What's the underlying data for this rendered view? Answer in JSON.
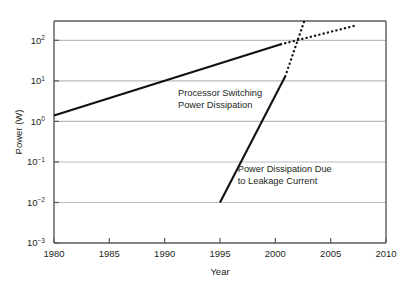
{
  "chart_data": {
    "type": "line",
    "title": "",
    "xlabel": "Year",
    "ylabel": "Power (W)",
    "xlim": [
      1980,
      2010
    ],
    "ylim": [
      0.001,
      300
    ],
    "yscale": "log",
    "grid": true,
    "legend_position": "none",
    "x_ticks": [
      {
        "value": 1980,
        "label": "1980"
      },
      {
        "value": 1985,
        "label": "1985"
      },
      {
        "value": 1990,
        "label": "1990"
      },
      {
        "value": 1995,
        "label": "1995"
      },
      {
        "value": 2000,
        "label": "2000"
      },
      {
        "value": 2005,
        "label": "2005"
      },
      {
        "value": 2010,
        "label": "2010"
      }
    ],
    "y_ticks": [
      {
        "value": 100,
        "mantissa": "10",
        "exponent": "2"
      },
      {
        "value": 10,
        "mantissa": "10",
        "exponent": "1"
      },
      {
        "value": 1,
        "mantissa": "10",
        "exponent": "0"
      },
      {
        "value": 0.1,
        "mantissa": "10",
        "exponent": "−1"
      },
      {
        "value": 0.01,
        "mantissa": "10",
        "exponent": "−2"
      },
      {
        "value": 0.001,
        "mantissa": "10",
        "exponent": "−3"
      }
    ],
    "series": [
      {
        "name": "Processor Switching Power Dissipation",
        "style": "solid",
        "color": "#111111",
        "points": [
          [
            1980,
            1.4
          ],
          [
            2000.5,
            80
          ]
        ]
      },
      {
        "name": "Processor Switching Power Dissipation (projected)",
        "style": "dotted",
        "color": "#111111",
        "points": [
          [
            2000.5,
            80
          ],
          [
            2007.2,
            230
          ]
        ]
      },
      {
        "name": "Power Dissipation Due to Leakage Current",
        "style": "solid",
        "color": "#111111",
        "points": [
          [
            1995,
            0.01
          ],
          [
            2000.9,
            13
          ]
        ]
      },
      {
        "name": "Power Dissipation Due to Leakage Current (projected)",
        "style": "dotted",
        "color": "#111111",
        "points": [
          [
            2000.9,
            13
          ],
          [
            2002.6,
            290
          ]
        ]
      }
    ],
    "annotations": [
      {
        "name": "switching-annotation",
        "lines": [
          "Processor Switching",
          "Power Dissipation"
        ],
        "x": 1991.2,
        "y": 4.2
      },
      {
        "name": "leakage-annotation",
        "lines": [
          "Power Dissipation Due",
          "to Leakage Current"
        ],
        "x": 1996.6,
        "y": 0.055
      }
    ]
  }
}
